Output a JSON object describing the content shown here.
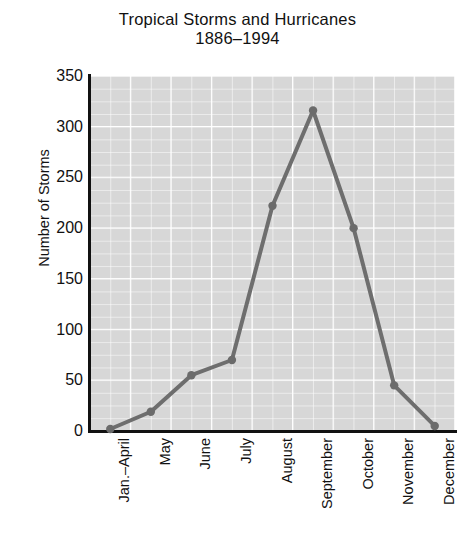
{
  "chart_data": {
    "type": "line",
    "title": "Tropical Storms and Hurricanes",
    "subtitle": "1886–1994",
    "xlabel": "",
    "ylabel": "Number of Storms",
    "categories": [
      "Jan.–April",
      "May",
      "June",
      "July",
      "August",
      "September",
      "October",
      "November",
      "December"
    ],
    "values": [
      2,
      19,
      55,
      70,
      222,
      316,
      200,
      45,
      5
    ],
    "series": [
      {
        "name": "Number of Storms",
        "values": [
          2,
          19,
          55,
          70,
          222,
          316,
          200,
          45,
          5
        ]
      }
    ],
    "ylim": [
      0,
      350
    ],
    "y_ticks": [
      0,
      50,
      100,
      150,
      200,
      250,
      300,
      350
    ],
    "y_tick_labels": [
      "0",
      "50",
      "100",
      "150",
      "200",
      "250",
      "300",
      "350"
    ],
    "grid": true,
    "grid_style": "major and minor white gridlines on gray panel",
    "legend": false,
    "legend_position": "none",
    "marker": "circle",
    "colors": {
      "line": "#6e6e6e",
      "marker": "#6b6b6b",
      "panel_background": "#d7d7d7",
      "gridline": "#ffffff",
      "axis": "#111111",
      "text": "#111111",
      "figure_background": "#ffffff"
    }
  }
}
